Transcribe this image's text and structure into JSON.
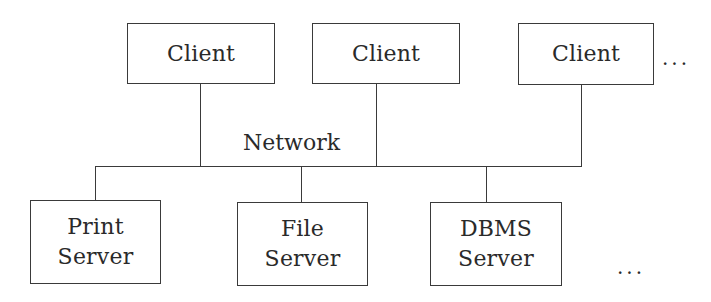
{
  "diagram": {
    "network_label": "Network",
    "clients": [
      {
        "label": "Client"
      },
      {
        "label": "Client"
      },
      {
        "label": "Client"
      }
    ],
    "clients_more": "...",
    "servers": [
      {
        "line1": "Print",
        "line2": "Server"
      },
      {
        "line1": "File",
        "line2": "Server"
      },
      {
        "line1": "DBMS",
        "line2": "Server"
      }
    ],
    "servers_more": "..."
  }
}
